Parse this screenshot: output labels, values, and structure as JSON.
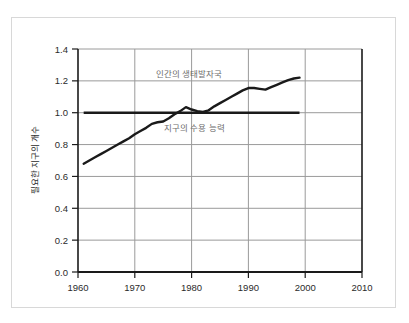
{
  "chart_data": {
    "type": "line",
    "title": "",
    "subtitle": "",
    "xlabel": "",
    "ylabel": "필요한 지구의 개수",
    "xlim": [
      1960,
      2010
    ],
    "ylim": [
      0.0,
      1.4
    ],
    "grid": true,
    "legend_position": "inline-annotation",
    "xticks": [
      "1960",
      "1970",
      "1980",
      "1990",
      "2000",
      "2010"
    ],
    "xtick_values": [
      1960,
      1970,
      1980,
      1990,
      2000,
      2010
    ],
    "yticks": [
      "0.0",
      "0.2",
      "0.4",
      "0.6",
      "0.8",
      "1.0",
      "1.2",
      "1.4"
    ],
    "ytick_values": [
      0.0,
      0.2,
      0.4,
      0.6,
      0.8,
      1.0,
      1.2,
      1.4
    ],
    "series": [
      {
        "name": "인간의 생태발자국",
        "color": "#1a1a1a",
        "x": [
          1961,
          1962,
          1963,
          1964,
          1965,
          1966,
          1967,
          1968,
          1969,
          1970,
          1971,
          1972,
          1973,
          1974,
          1975,
          1976,
          1977,
          1978,
          1979,
          1980,
          1981,
          1982,
          1983,
          1984,
          1985,
          1986,
          1987,
          1988,
          1989,
          1990,
          1991,
          1992,
          1993,
          1994,
          1995,
          1996,
          1997,
          1998,
          1999
        ],
        "values": [
          0.68,
          0.7,
          0.72,
          0.74,
          0.76,
          0.78,
          0.8,
          0.82,
          0.84,
          0.865,
          0.885,
          0.905,
          0.93,
          0.94,
          0.945,
          0.965,
          0.99,
          1.01,
          1.035,
          1.02,
          1.01,
          1.005,
          1.015,
          1.04,
          1.06,
          1.08,
          1.1,
          1.12,
          1.14,
          1.155,
          1.155,
          1.15,
          1.145,
          1.16,
          1.175,
          1.19,
          1.205,
          1.215,
          1.22
        ]
      },
      {
        "name": "지구의 수용 능력",
        "color": "#1a1a1a",
        "x": [
          1961,
          1999
        ],
        "values": [
          1.0,
          1.0
        ]
      }
    ],
    "annotations": [
      {
        "text": "인간의 생태발자국",
        "x": 1979.5,
        "y": 1.225,
        "color": "#6d6d6d"
      },
      {
        "text": "지구의 수용 능력",
        "x": 1980.5,
        "y": 0.885,
        "color": "#6d6d6d"
      }
    ]
  },
  "axes": {
    "y_axis_title": "필요한 지구의 개수",
    "x_axis_title": ""
  },
  "colors": {
    "line": "#1a1a1a",
    "grid": "#9a9a9a",
    "axis": "#1a1a1a",
    "annotation": "#6d6d6d",
    "frame": "#d8d8d8"
  }
}
